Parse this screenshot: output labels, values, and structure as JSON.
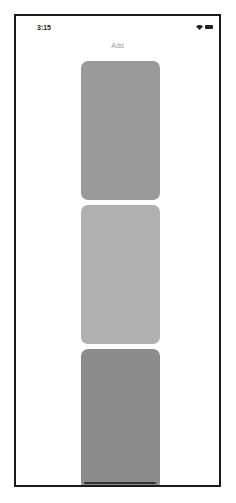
{
  "status_bar": {
    "time": "3:15",
    "icons": [
      "wifi-icon",
      "battery-icon"
    ]
  },
  "header": {
    "title": "Add"
  },
  "cards": [
    {
      "color": "#9a9a9a"
    },
    {
      "color": "#b0b0b0"
    },
    {
      "color": "#8c8c8c"
    }
  ]
}
